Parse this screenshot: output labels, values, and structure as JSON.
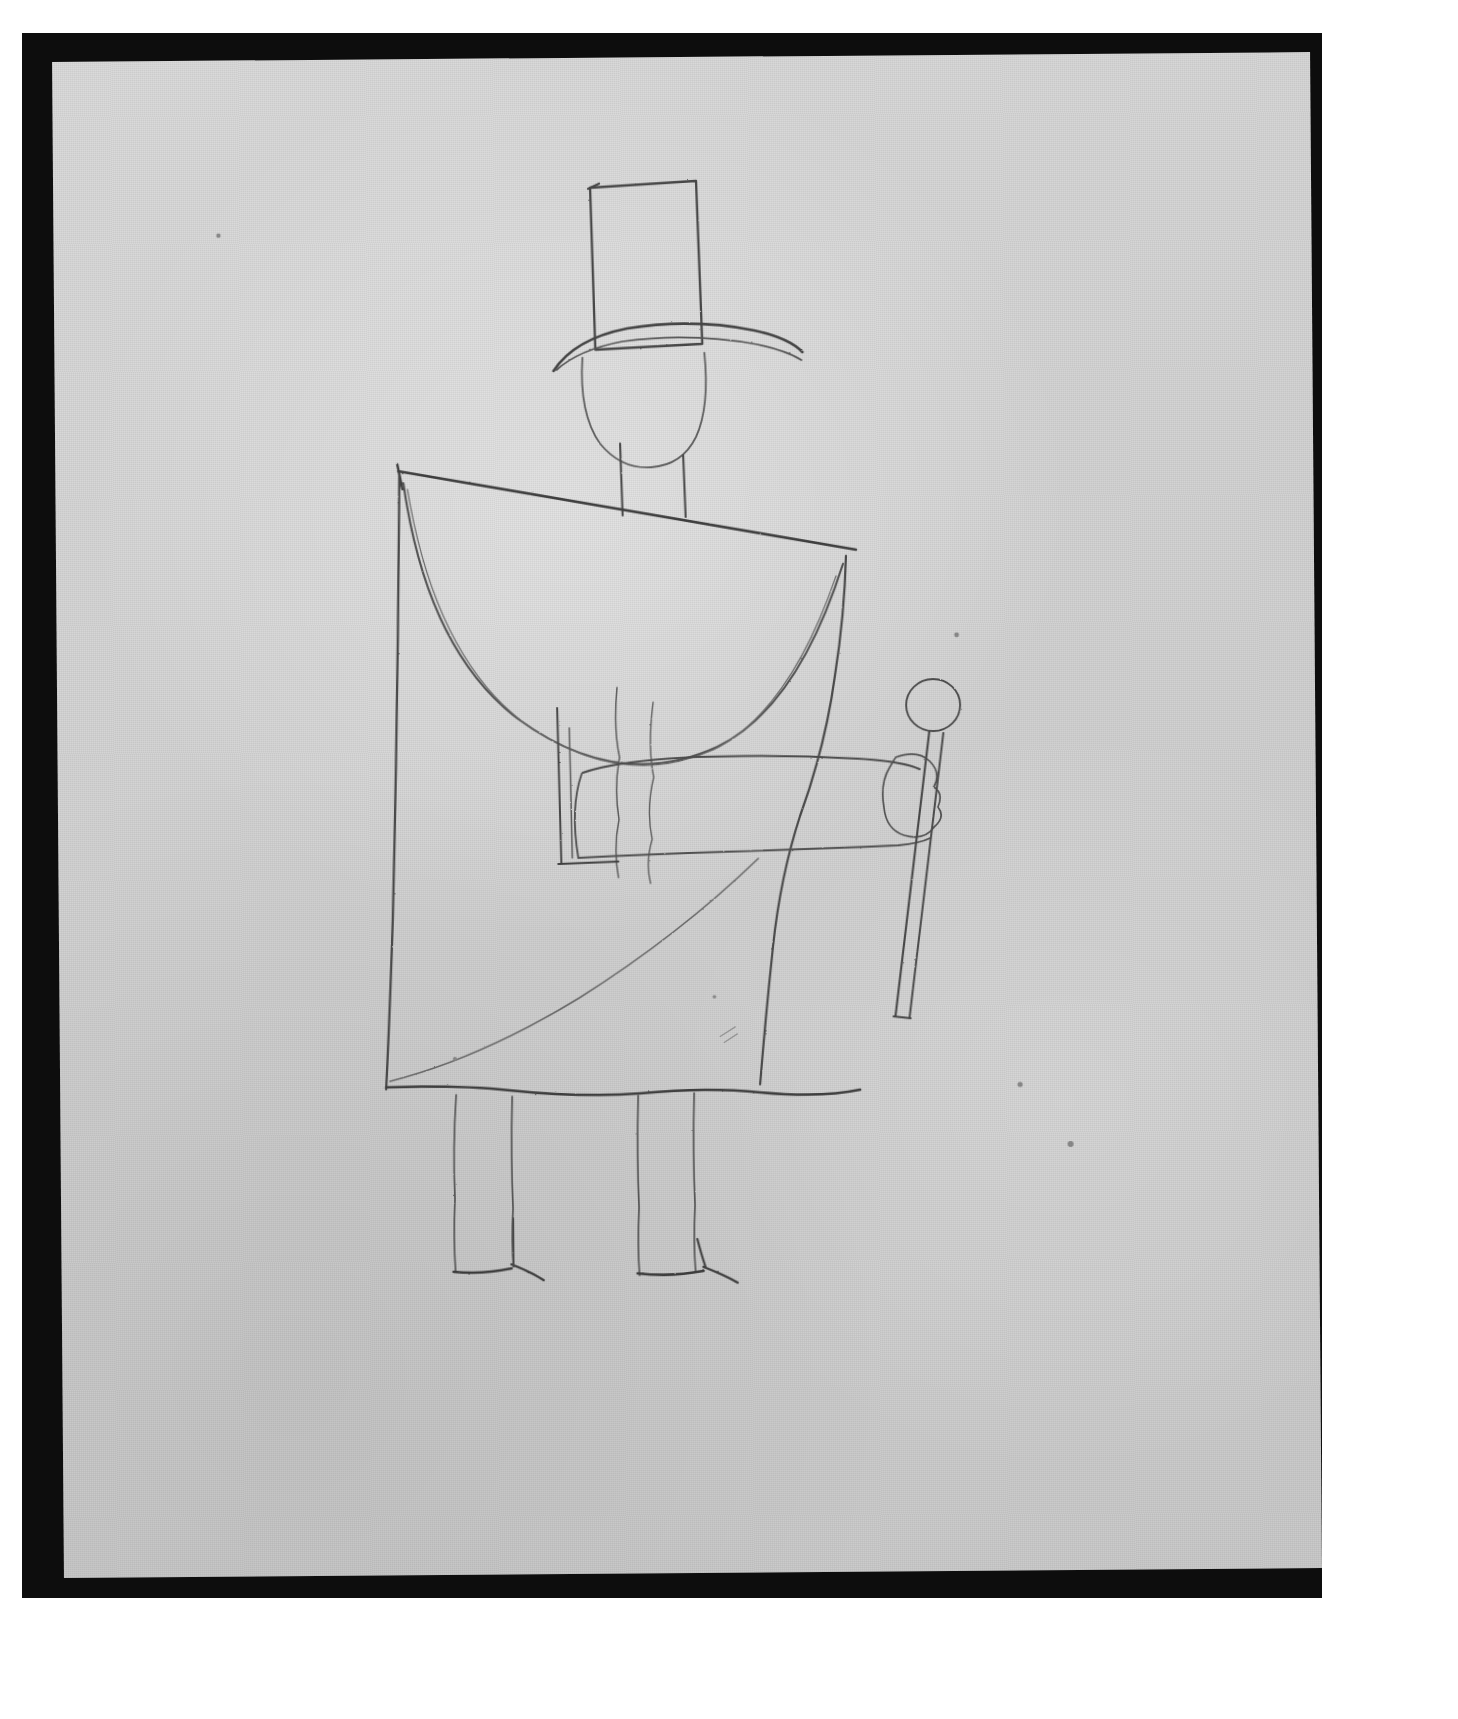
{
  "plate": {
    "medium": "graphite pencil on paper",
    "subject": "standing figure in top hat and cape holding a cane",
    "faint_header_text": "",
    "background_color": "#ffffff",
    "frame_color": "#0d0d0d",
    "paper_color": "#d6d6d6",
    "pencil_color": "#4a4a4a",
    "pencil_color_light": "#6f6f6f",
    "frame": {
      "x": 22,
      "y": 33,
      "width": 1300,
      "height": 1565
    },
    "paper": {
      "x": 58,
      "y": 57,
      "width": 1258,
      "height": 1516,
      "rotation_deg": -0.45
    }
  },
  "drawing": {
    "title": "Figure with Top Hat and Cane",
    "elements": [
      {
        "name": "top-hat-crown",
        "description": "tall rectangular hat crown"
      },
      {
        "name": "top-hat-brim",
        "description": "curved brim line beneath crown"
      },
      {
        "name": "head",
        "description": "rounded head outline below brim"
      },
      {
        "name": "neck",
        "description": "two short vertical neck lines"
      },
      {
        "name": "cape-shoulder-line",
        "description": "long straight line forming shoulders, sloping slightly down to the right"
      },
      {
        "name": "cape-left-edge",
        "description": "long vertical left edge of cape falling to hem"
      },
      {
        "name": "cape-right-edge",
        "description": "long wavering vertical right edge of cape"
      },
      {
        "name": "cape-collar-curve",
        "description": "large semicircular curve forming the cape collar"
      },
      {
        "name": "cape-diagonal-fold",
        "description": "diagonal fold sweeping from lower left up to the right"
      },
      {
        "name": "coat-body-line",
        "description": "wavering vertical line inside cape"
      },
      {
        "name": "arm",
        "description": "horizontal sleeve extending right to the hand"
      },
      {
        "name": "hand",
        "description": "small lobed hand gripping the cane"
      },
      {
        "name": "cane-knob",
        "description": "round knob at top of cane"
      },
      {
        "name": "cane-shaft",
        "description": "narrow double-line shaft descending to a flat tip"
      },
      {
        "name": "hem-line",
        "description": "wavering horizontal hem at bottom of cape"
      },
      {
        "name": "leg-left",
        "description": "left leg, two vertical lines"
      },
      {
        "name": "leg-right",
        "description": "right leg, two vertical lines"
      },
      {
        "name": "foot-left",
        "description": "pointed shoe facing right"
      },
      {
        "name": "foot-right",
        "description": "pointed shoe facing right"
      }
    ]
  },
  "chart_data": null
}
